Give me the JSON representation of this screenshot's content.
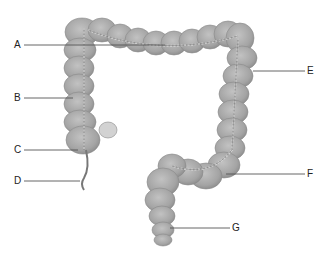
{
  "diagram": {
    "labels": [
      {
        "id": "A",
        "text": "A",
        "x": 14,
        "y": 40,
        "line": [
          [
            24,
            45
          ],
          [
            165,
            45
          ]
        ]
      },
      {
        "id": "B",
        "text": "B",
        "x": 14,
        "y": 93,
        "line": [
          [
            24,
            98
          ],
          [
            73,
            98
          ]
        ]
      },
      {
        "id": "C",
        "text": "C",
        "x": 14,
        "y": 145,
        "line": [
          [
            24,
            150
          ],
          [
            78,
            150
          ]
        ]
      },
      {
        "id": "D",
        "text": "D",
        "x": 14,
        "y": 175,
        "line": [
          [
            24,
            180
          ],
          [
            80,
            181
          ]
        ]
      },
      {
        "id": "E",
        "text": "E",
        "x": 307,
        "y": 65,
        "line": [
          [
            253,
            70
          ],
          [
            305,
            70
          ]
        ]
      },
      {
        "id": "F",
        "text": "F",
        "x": 307,
        "y": 168,
        "line": [
          [
            226,
            173
          ],
          [
            305,
            173
          ]
        ]
      },
      {
        "id": "G",
        "text": "G",
        "x": 232,
        "y": 221,
        "line": [
          [
            170,
            228
          ],
          [
            230,
            228
          ]
        ]
      }
    ],
    "colors": {
      "organ_fill": "#a9a9a9",
      "organ_shade": "#8f8f8f",
      "organ_highlight": "#c4c4c4",
      "vessel": "#e0e0e0",
      "line": "#555555",
      "text": "#222222"
    }
  }
}
